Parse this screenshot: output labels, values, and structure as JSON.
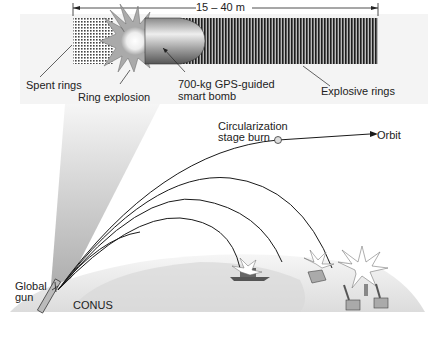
{
  "top_panel": {
    "dimension_label": "15 – 40 m",
    "labels": {
      "spent_rings": "Spent rings",
      "ring_explosion": "Ring explosion",
      "smart_bomb_line1": "700-kg GPS-guided",
      "smart_bomb_line2": "smart bomb",
      "explosive_rings": "Explosive rings"
    }
  },
  "bottom_panel": {
    "labels": {
      "circularization_line1": "Circularization",
      "circularization_line2": "stage burn",
      "orbit": "Orbit",
      "global_gun_line1": "Global",
      "global_gun_line2": "gun",
      "conus": "CONUS"
    },
    "targets": [
      "ship",
      "bunker",
      "missile-sites"
    ]
  },
  "colors": {
    "line": "#1a1a1a",
    "earth_light": "#f2f2f2",
    "earth_dark": "#d6d6d6",
    "ring_dark": "#2a2a2a"
  }
}
